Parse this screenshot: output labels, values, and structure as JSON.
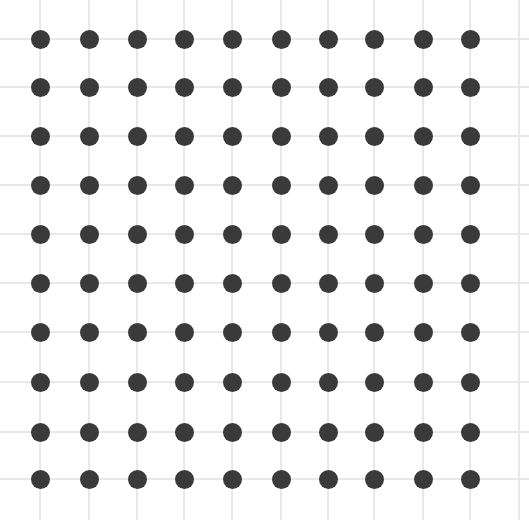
{
  "grid": {
    "columns_x": [
      40,
      89,
      137,
      184,
      232,
      281,
      328,
      374,
      423,
      470
    ],
    "extra_vlines_x": [
      519
    ],
    "rows_y": [
      39,
      87,
      136,
      185,
      234,
      283,
      332,
      382,
      432,
      479
    ],
    "line_color": "#e8e8e8",
    "dot_color": "#3a3a3a",
    "dot_diameter": 19,
    "dot_count": 100
  }
}
